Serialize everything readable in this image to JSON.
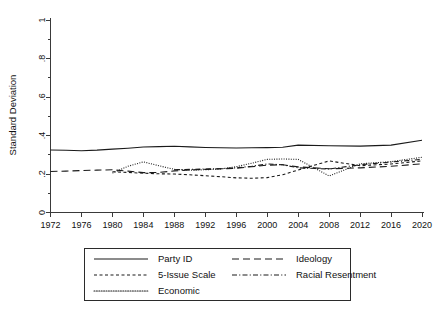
{
  "chart_data": {
    "type": "line",
    "title": "",
    "xlabel": "",
    "ylabel": "Standard Deviation",
    "ylim": [
      0,
      1
    ],
    "xlim": [
      1972,
      2020
    ],
    "grid": false,
    "legend_position": "below-axes",
    "y_ticks": [
      "0",
      ".2",
      ".4",
      ".6",
      ".8",
      "1"
    ],
    "y_tick_values": [
      0,
      0.2,
      0.4,
      0.6,
      0.8,
      1
    ],
    "x_ticks": [
      "1972",
      "1976",
      "1980",
      "1984",
      "1988",
      "1992",
      "1996",
      "2000",
      "2004",
      "2008",
      "2012",
      "2016",
      "2020"
    ],
    "x_tick_values": [
      1972,
      1976,
      1980,
      1984,
      1988,
      1992,
      1996,
      2000,
      2004,
      2008,
      2012,
      2016,
      2020
    ],
    "series": [
      {
        "name": "Party ID",
        "style": "solid",
        "dash": "none",
        "color": "#1a1a1a",
        "x": [
          1972,
          1974,
          1976,
          1978,
          1980,
          1982,
          1984,
          1986,
          1988,
          1990,
          1992,
          1994,
          1996,
          1998,
          2000,
          2002,
          2004,
          2008,
          2012,
          2016,
          2020
        ],
        "values": [
          0.325,
          0.323,
          0.321,
          0.324,
          0.329,
          0.334,
          0.34,
          0.342,
          0.344,
          0.341,
          0.338,
          0.336,
          0.335,
          0.336,
          0.337,
          0.339,
          0.35,
          0.347,
          0.345,
          0.35,
          0.375
        ]
      },
      {
        "name": "Ideology",
        "style": "long-dash",
        "dash": "7,4",
        "color": "#1a1a1a",
        "x": [
          1972,
          1974,
          1976,
          1978,
          1980,
          1982,
          1984,
          1986,
          1988,
          1990,
          1992,
          1994,
          1996,
          1998,
          2000,
          2002,
          2004,
          2008,
          2012,
          2016,
          2020
        ],
        "values": [
          0.213,
          0.215,
          0.218,
          0.22,
          0.222,
          0.215,
          0.207,
          0.208,
          0.216,
          0.221,
          0.224,
          0.227,
          0.23,
          0.238,
          0.246,
          0.248,
          0.237,
          0.227,
          0.232,
          0.24,
          0.253
        ]
      },
      {
        "name": "5-Issue Scale",
        "style": "short-dash",
        "dash": "3,2.5",
        "color": "#1a1a1a",
        "x": [
          1980,
          1982,
          1984,
          1986,
          1988,
          1990,
          1992,
          1994,
          1996,
          1998,
          2000,
          2002,
          2004,
          2008,
          2012,
          2016,
          2020
        ],
        "values": [
          0.212,
          0.208,
          0.204,
          0.201,
          0.2,
          0.196,
          0.191,
          0.186,
          0.18,
          0.178,
          0.181,
          0.196,
          0.221,
          0.268,
          0.243,
          0.252,
          0.268
        ]
      },
      {
        "name": "Racial Resentment",
        "style": "dash-dot",
        "dash": "5,2.2,1.1,2.2",
        "color": "#1a1a1a",
        "x": [
          1988,
          1990,
          1992,
          1994,
          1996,
          1998,
          2000,
          2002,
          2004,
          2008,
          2012,
          2016,
          2020
        ],
        "values": [
          0.222,
          0.224,
          0.226,
          0.228,
          0.232,
          0.24,
          0.252,
          0.248,
          0.232,
          0.226,
          0.248,
          0.262,
          0.276
        ]
      },
      {
        "name": "Economic",
        "style": "dotted",
        "dash": "1,1.4",
        "color": "#8a8a8a",
        "x": [
          1980,
          1982,
          1984,
          1986,
          1988,
          1990,
          1992,
          1994,
          1996,
          1998,
          2000,
          2002,
          2004,
          2008,
          2012,
          2016,
          2020
        ],
        "values": [
          0.205,
          0.24,
          0.263,
          0.243,
          0.224,
          0.22,
          0.222,
          0.226,
          0.238,
          0.256,
          0.276,
          0.278,
          0.276,
          0.19,
          0.253,
          0.264,
          0.287
        ]
      }
    ],
    "legend": [
      {
        "label": "Party ID",
        "style": "solid"
      },
      {
        "label": "Ideology",
        "style": "long-dash"
      },
      {
        "label": "5-Issue Scale",
        "style": "short-dash"
      },
      {
        "label": "Racial Resentment",
        "style": "dash-dot"
      },
      {
        "label": "Economic",
        "style": "dotted"
      }
    ]
  }
}
